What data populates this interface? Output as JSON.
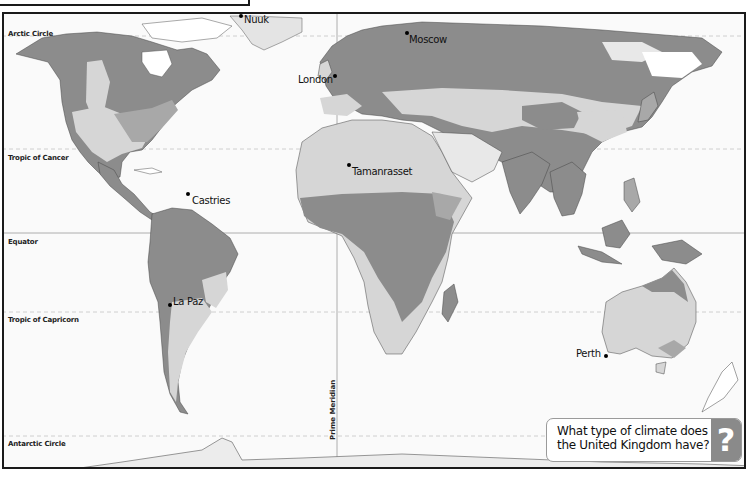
{
  "map": {
    "title_box": "",
    "colors": {
      "ocean": "#fafafa",
      "dark_zone": "#8c8c8c",
      "mid_zone": "#a8a8a8",
      "light_zone": "#d6d6d6",
      "pale_zone": "#e8e8e8",
      "white_land": "#ffffff",
      "border": "#333333",
      "lat_line": "#bdbdbd"
    },
    "latitude_lines": [
      {
        "label": "Arctic Circle",
        "y": 34,
        "style": "dashed"
      },
      {
        "label": "Tropic of Cancer",
        "y": 147,
        "style": "dashed"
      },
      {
        "label": "Equator",
        "y": 231,
        "style": "solid"
      },
      {
        "label": "Tropic of Capricorn",
        "y": 310,
        "style": "dashed"
      },
      {
        "label": "Antarctic Circle",
        "y": 434,
        "style": "dashed"
      }
    ],
    "prime_meridian": {
      "label": "Prime Meridian",
      "x": 335
    },
    "cities": [
      {
        "name": "Nuuk",
        "x": 238,
        "y": 14
      },
      {
        "name": "London",
        "x": 332,
        "y": 73
      },
      {
        "name": "Moscow",
        "x": 404,
        "y": 30
      },
      {
        "name": "Tamanrasset",
        "x": 346,
        "y": 162
      },
      {
        "name": "Castries",
        "x": 185,
        "y": 192
      },
      {
        "name": "La Paz",
        "x": 167,
        "y": 302
      },
      {
        "name": "Perth",
        "x": 602,
        "y": 352
      }
    ],
    "question": {
      "text_line1": "What type of climate does",
      "text_line2": "the United Kingdom have?",
      "icon": "?"
    }
  }
}
